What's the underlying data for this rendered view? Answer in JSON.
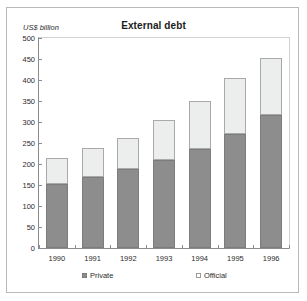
{
  "figure": {
    "title": "External debt",
    "y_unit_label": "US$  billion",
    "legend": [
      {
        "label": "Private",
        "color": "#8d8d8d",
        "key": "private"
      },
      {
        "label": "Official",
        "color": "#eceded",
        "key": "official"
      }
    ]
  },
  "chart_data": {
    "type": "bar",
    "subtype": "stacked-vertical",
    "title": "External debt",
    "xlabel": "",
    "ylabel": "US$  billion",
    "ylim": [
      0,
      500
    ],
    "ytick_step": 50,
    "yticks": [
      0,
      50,
      100,
      150,
      200,
      250,
      300,
      350,
      400,
      450,
      500
    ],
    "ytick_labels": [
      "0",
      "50",
      "100",
      "150",
      "200",
      "250",
      "300",
      "350",
      "400",
      "450",
      "500"
    ],
    "grid": false,
    "legend_position": "bottom",
    "categories": [
      "1990",
      "1991",
      "1992",
      "1993",
      "1994",
      "1995",
      "1996"
    ],
    "series": [
      {
        "name": "Private",
        "color": "#8d8d8d",
        "values": [
          152,
          168,
          189,
          209,
          235,
          271,
          316
        ]
      },
      {
        "name": "Official",
        "color": "#eceded",
        "values": [
          63,
          69,
          74,
          95,
          116,
          134,
          136
        ]
      }
    ],
    "totals": [
      215,
      237,
      263,
      304,
      351,
      405,
      452
    ]
  }
}
